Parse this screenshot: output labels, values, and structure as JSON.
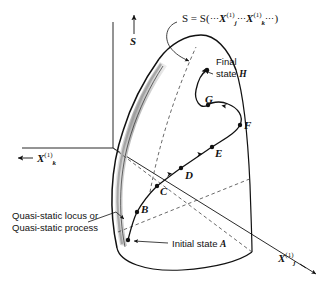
{
  "figure": {
    "title_equation": {
      "prefix": "S = S(",
      "dots1": "⋯",
      "var1_base": "X",
      "var1_sub": "j",
      "var1_sup": "(1)",
      "dots2": "⋯",
      "var2_base": "X",
      "var2_sub": "k",
      "var2_sup": "(1)",
      "dots3": "⋯",
      "suffix": ")",
      "full_text": "S = S( ⋯ Xj(1) ⋯ Xk(1) ⋯ )"
    },
    "axes": {
      "vertical": {
        "label": "S",
        "arrow": "up"
      },
      "left": {
        "base": "X",
        "sub": "k",
        "sup": "(1)",
        "arrow": "left",
        "full_text": "← Xk(1)"
      },
      "right": {
        "base": "X",
        "sub": "j",
        "sup": "(1)",
        "arrow": "down-right",
        "full_text": "Xj(1) →"
      }
    },
    "callouts": {
      "final_state": {
        "line1": "Final",
        "line2_prefix": "state ",
        "line2_point": "H"
      },
      "initial_state": {
        "prefix": "Initial state ",
        "point": "A"
      },
      "quasi_static": {
        "line1": "Quasi-static locus or",
        "line2": "Quasi-static process"
      }
    },
    "points": [
      {
        "id": "A",
        "label": "A",
        "x": 128,
        "y": 240
      },
      {
        "id": "B",
        "label": "B",
        "x": 137,
        "y": 212
      },
      {
        "id": "C",
        "label": "C",
        "x": 157,
        "y": 186
      },
      {
        "id": "D",
        "label": "D",
        "x": 181,
        "y": 168
      },
      {
        "id": "E",
        "label": "E",
        "x": 212,
        "y": 147
      },
      {
        "id": "F",
        "label": "F",
        "x": 240,
        "y": 125
      },
      {
        "id": "G",
        "label": "G",
        "x": 208,
        "y": 105
      },
      {
        "id": "H",
        "label": "H",
        "x": 207,
        "y": 70
      }
    ],
    "colors": {
      "ink": "#111111",
      "band_gray": "#b8b8b8",
      "band_gray_light": "#d6d6d6",
      "dashed": "#555555",
      "background": "#ffffff"
    }
  }
}
